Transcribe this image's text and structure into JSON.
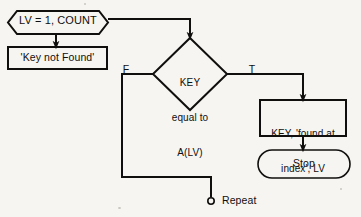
{
  "diagram": {
    "type": "flowchart",
    "background_color": "#f6f5f2",
    "line_color": "#100f0d",
    "nodes": [
      {
        "id": "loop-init",
        "shape": "hexagon",
        "text": "LV = 1, COUNT",
        "x": 8,
        "y": 11,
        "w": 100,
        "h": 23
      },
      {
        "id": "key-not-found",
        "shape": "rectangle",
        "text": "'Key not Found'",
        "x": 8,
        "y": 47,
        "w": 99,
        "h": 22
      },
      {
        "id": "decision",
        "shape": "diamond",
        "text": "KEY\nequal to\nA(LV)",
        "lines": [
          "KEY",
          "equal to",
          "A(LV)"
        ],
        "x": 153,
        "y": 38,
        "w": 74,
        "h": 72
      },
      {
        "id": "found-at-index",
        "shape": "rectangle",
        "text": "KEY, 'found at\nindex', LV",
        "lines": [
          "KEY, 'found at",
          "index', LV"
        ],
        "x": 260,
        "y": 100,
        "w": 86,
        "h": 36
      },
      {
        "id": "stop",
        "shape": "terminator",
        "text": "Stop",
        "x": 258,
        "y": 150,
        "w": 92,
        "h": 28
      },
      {
        "id": "repeat-connector",
        "shape": "circle",
        "text": "",
        "x": 208,
        "y": 198,
        "w": 6,
        "h": 6
      }
    ],
    "edge_labels": [
      {
        "id": "false-branch",
        "text": "F",
        "x": 120,
        "y": 63
      },
      {
        "id": "true-branch",
        "text": "T",
        "x": 246,
        "y": 63
      },
      {
        "id": "repeat-label",
        "text": "Repeat",
        "x": 222,
        "y": 194
      }
    ]
  }
}
